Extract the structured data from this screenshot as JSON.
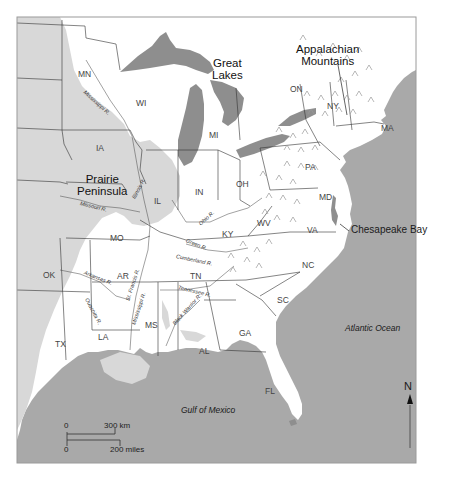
{
  "map": {
    "colors": {
      "ocean": "#a9a9a9",
      "lakes": "#8e8e8e",
      "prairie": "#d8d8d8",
      "land": "#ffffff",
      "border": "#333333",
      "frame": "#9a9a9a"
    },
    "region_labels": {
      "great_lakes": "Great\nLakes",
      "appalachian": "Appalachian\nMountains",
      "prairie": "Prairie\nPeninsula",
      "chesapeake": "Chesapeake Bay",
      "atlantic": "Atlantic Ocean",
      "gulf": "Gulf of Mexico"
    },
    "states": [
      {
        "code": "MN",
        "x": 78,
        "y": 70
      },
      {
        "code": "WI",
        "x": 136,
        "y": 99
      },
      {
        "code": "MI",
        "x": 209,
        "y": 131
      },
      {
        "code": "ON",
        "x": 290,
        "y": 85
      },
      {
        "code": "NY",
        "x": 327,
        "y": 102
      },
      {
        "code": "MA",
        "x": 381,
        "y": 124
      },
      {
        "code": "IA",
        "x": 96,
        "y": 144
      },
      {
        "code": "IL",
        "x": 154,
        "y": 197
      },
      {
        "code": "IN",
        "x": 195,
        "y": 188
      },
      {
        "code": "OH",
        "x": 236,
        "y": 180
      },
      {
        "code": "PA",
        "x": 305,
        "y": 163
      },
      {
        "code": "MD",
        "x": 319,
        "y": 193
      },
      {
        "code": "WV",
        "x": 257,
        "y": 219
      },
      {
        "code": "VA",
        "x": 307,
        "y": 226
      },
      {
        "code": "KY",
        "x": 222,
        "y": 230
      },
      {
        "code": "MO",
        "x": 110,
        "y": 234
      },
      {
        "code": "NC",
        "x": 302,
        "y": 261
      },
      {
        "code": "TN",
        "x": 190,
        "y": 272
      },
      {
        "code": "AR",
        "x": 117,
        "y": 272
      },
      {
        "code": "OK",
        "x": 43,
        "y": 271
      },
      {
        "code": "SC",
        "x": 277,
        "y": 296
      },
      {
        "code": "MS",
        "x": 145,
        "y": 321
      },
      {
        "code": "LA",
        "x": 98,
        "y": 333
      },
      {
        "code": "GA",
        "x": 239,
        "y": 329
      },
      {
        "code": "AL",
        "x": 199,
        "y": 347
      },
      {
        "code": "TX",
        "x": 55,
        "y": 340
      },
      {
        "code": "FL",
        "x": 265,
        "y": 387
      }
    ],
    "rivers": [
      {
        "name": "Mississippi R.",
        "x": 84,
        "y": 89,
        "rot": 42
      },
      {
        "name": "Illinois R.",
        "x": 134,
        "y": 196,
        "rot": -62
      },
      {
        "name": "Missouri R.",
        "x": 80,
        "y": 201,
        "rot": 14
      },
      {
        "name": "Ohio R.",
        "x": 200,
        "y": 222,
        "rot": -42
      },
      {
        "name": "Green R.",
        "x": 186,
        "y": 238,
        "rot": 22
      },
      {
        "name": "Cumberland R.",
        "x": 176,
        "y": 254,
        "rot": 12
      },
      {
        "name": "Arkansas R.",
        "x": 84,
        "y": 270,
        "rot": 22
      },
      {
        "name": "St. Francis R.",
        "x": 128,
        "y": 298,
        "rot": -72
      },
      {
        "name": "Mississippi R.",
        "x": 134,
        "y": 322,
        "rot": -72
      },
      {
        "name": "Tennessee R.",
        "x": 178,
        "y": 285,
        "rot": 14
      },
      {
        "name": "Black Warrior R.",
        "x": 174,
        "y": 322,
        "rot": -48
      },
      {
        "name": "Ouachita R.",
        "x": 86,
        "y": 296,
        "rot": 62
      }
    ],
    "scale_bar": {
      "km_zero": "0",
      "km_label": "300 km",
      "mi_zero": "0",
      "mi_label": "200 miles"
    },
    "north_arrow": {
      "label": "N"
    }
  }
}
